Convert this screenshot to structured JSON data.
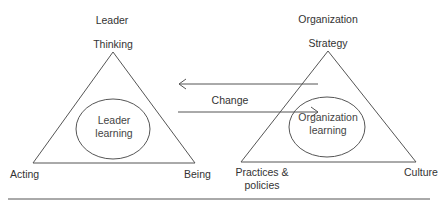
{
  "left_model": {
    "title": "Leader",
    "top_vertex": "Thinking",
    "bottom_left_vertex": "Acting",
    "bottom_right_vertex": "Being",
    "center_line1": "Leader",
    "center_line2": "learning"
  },
  "right_model": {
    "title": "Organization",
    "top_vertex": "Strategy",
    "bottom_left_line1": "Practices &",
    "bottom_left_line2": "policies",
    "bottom_right_vertex": "Culture",
    "center_line1": "Organization",
    "center_line2": "learning"
  },
  "connector": {
    "label": "Change"
  },
  "colors": {
    "stroke": "#555555",
    "text": "#333333",
    "background": "#ffffff"
  }
}
